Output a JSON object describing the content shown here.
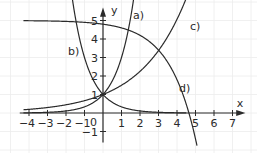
{
  "chart_data": {
    "type": "line",
    "title": "",
    "xlabel": "x",
    "ylabel": "y",
    "origin_label": "0",
    "xlim": [
      -4.5,
      7.5
    ],
    "ylim": [
      -1.5,
      5.5
    ],
    "grid": true,
    "x_ticks": [
      -4,
      -3,
      -2,
      -1,
      1,
      2,
      3,
      4,
      5,
      6,
      7
    ],
    "x_tick_labels": [
      "−4",
      "−3",
      "−2",
      "−1",
      "1",
      "2",
      "3",
      "4",
      "5",
      "6",
      "7"
    ],
    "y_ticks": [
      -1,
      1,
      2,
      3,
      4,
      5
    ],
    "y_tick_labels": [
      "−1",
      "1",
      "2",
      "3",
      "4",
      "5"
    ],
    "series": [
      {
        "name": "a)",
        "formula": "y = 3^x",
        "x": [
          -4,
          -3,
          -2,
          -1,
          0,
          1,
          1.5,
          1.7
        ],
        "values": [
          0.01,
          0.04,
          0.11,
          0.33,
          1,
          3,
          5.2,
          6.5
        ]
      },
      {
        "name": "b)",
        "formula": "y = (1/3)^x",
        "x": [
          -1.7,
          -1.5,
          -1,
          0,
          1,
          2
        ],
        "values": [
          6.5,
          5.2,
          3,
          1,
          0.33,
          0.11
        ]
      },
      {
        "name": "c)",
        "formula": "y = 1.5^x",
        "x": [
          -4,
          -2,
          0,
          2,
          3,
          4,
          4.6
        ],
        "values": [
          0.2,
          0.44,
          1,
          2.25,
          3.38,
          5.06,
          6.4
        ]
      },
      {
        "name": "d)",
        "formula": "y = 5 - 0.2*2^x",
        "x": [
          -4,
          -2,
          0,
          2,
          3,
          4,
          4.64,
          5.1
        ],
        "values": [
          4.99,
          4.95,
          4.8,
          4.2,
          3.4,
          1.8,
          0,
          -1.9
        ]
      }
    ],
    "annotations": [
      {
        "text": "a)",
        "near": [
          1.2,
          5.1
        ]
      },
      {
        "text": "b)",
        "near": [
          -1.5,
          3.4
        ]
      },
      {
        "text": "c)",
        "near": [
          4.2,
          4.5
        ]
      },
      {
        "text": "d)",
        "near": [
          3.2,
          1.4
        ]
      }
    ],
    "legend": "inline labels"
  }
}
